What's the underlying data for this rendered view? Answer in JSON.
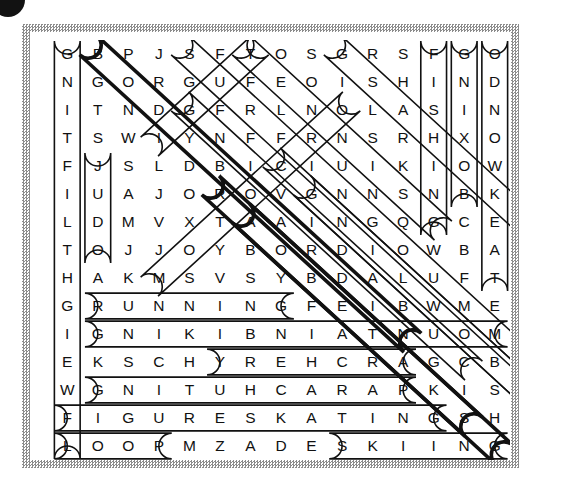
{
  "puzzle": {
    "type": "word-search",
    "rows": 15,
    "cols": 15,
    "grid": [
      [
        "G",
        "B",
        "P",
        "J",
        "S",
        "F",
        "T",
        "O",
        "S",
        "G",
        "R",
        "S",
        "F",
        "G",
        "O"
      ],
      [
        "N",
        "G",
        "O",
        "R",
        "G",
        "U",
        "F",
        "E",
        "O",
        "I",
        "S",
        "H",
        "I",
        "N",
        "D"
      ],
      [
        "I",
        "T",
        "N",
        "D",
        "G",
        "F",
        "R",
        "L",
        "N",
        "O",
        "L",
        "A",
        "S",
        "I",
        "N"
      ],
      [
        "T",
        "S",
        "W",
        "I",
        "Y",
        "N",
        "F",
        "F",
        "R",
        "N",
        "S",
        "R",
        "H",
        "X",
        "O"
      ],
      [
        "F",
        "J",
        "S",
        "L",
        "D",
        "B",
        "I",
        "C",
        "I",
        "U",
        "I",
        "K",
        "I",
        "O",
        "W"
      ],
      [
        "I",
        "U",
        "A",
        "J",
        "O",
        "R",
        "O",
        "V",
        "G",
        "N",
        "N",
        "S",
        "N",
        "B",
        "K"
      ],
      [
        "L",
        "D",
        "M",
        "V",
        "X",
        "T",
        "A",
        "A",
        "I",
        "N",
        "G",
        "Q",
        "G",
        "C",
        "E"
      ],
      [
        "T",
        "O",
        "J",
        "J",
        "O",
        "Y",
        "B",
        "O",
        "R",
        "D",
        "I",
        "O",
        "W",
        "B",
        "A"
      ],
      [
        "H",
        "A",
        "K",
        "M",
        "S",
        "V",
        "S",
        "Y",
        "B",
        "D",
        "A",
        "L",
        "U",
        "F",
        "T"
      ],
      [
        "G",
        "R",
        "U",
        "N",
        "N",
        "I",
        "N",
        "G",
        "F",
        "E",
        "I",
        "B",
        "W",
        "M",
        "E"
      ],
      [
        "I",
        "G",
        "N",
        "I",
        "K",
        "I",
        "B",
        "N",
        "I",
        "A",
        "T",
        "N",
        "U",
        "O",
        "M"
      ],
      [
        "E",
        "K",
        "S",
        "C",
        "H",
        "Y",
        "R",
        "E",
        "H",
        "C",
        "R",
        "A",
        "G",
        "C",
        "B"
      ],
      [
        "W",
        "G",
        "N",
        "I",
        "T",
        "U",
        "H",
        "C",
        "A",
        "R",
        "A",
        "P",
        "K",
        "I",
        "S"
      ],
      [
        "F",
        "I",
        "G",
        "U",
        "R",
        "E",
        "S",
        "K",
        "A",
        "T",
        "I",
        "N",
        "G",
        "S",
        "H"
      ],
      [
        "L",
        "O",
        "O",
        "P",
        "M",
        "Z",
        "A",
        "D",
        "E",
        "S",
        "K",
        "I",
        "I",
        "N",
        "G"
      ]
    ],
    "found_words": [
      {
        "name": "weightlifting",
        "text": "WEIGHTLIFTING",
        "direction": "vertical-up",
        "start": [
          14,
          0
        ],
        "end": [
          0,
          0
        ],
        "style": "thin"
      },
      {
        "name": "judo",
        "text": "JUDO",
        "direction": "vertical-down",
        "start": [
          4,
          1
        ],
        "end": [
          7,
          1
        ],
        "style": "thin"
      },
      {
        "name": "fishing",
        "text": "FISHING",
        "direction": "vertical-down",
        "start": [
          0,
          12
        ],
        "end": [
          6,
          12
        ],
        "style": "thin"
      },
      {
        "name": "boxing",
        "text": "BOXING",
        "direction": "vertical-up",
        "start": [
          5,
          13
        ],
        "end": [
          0,
          13
        ],
        "style": "thin"
      },
      {
        "name": "snowboarding",
        "text": "SNOWBOARDING",
        "direction": "vertical-up",
        "start": [
          8,
          14
        ],
        "end": [
          0,
          14
        ],
        "style": "thin"
      },
      {
        "name": "running",
        "text": "RUNNING",
        "direction": "horizontal",
        "start": [
          9,
          1
        ],
        "end": [
          9,
          7
        ],
        "style": "thin"
      },
      {
        "name": "mountainbiking",
        "text": "MOUNTAINBIKING",
        "direction": "horizontal-rev",
        "start": [
          10,
          14
        ],
        "end": [
          10,
          1
        ],
        "style": "thin"
      },
      {
        "name": "archery",
        "text": "ARCHERY",
        "direction": "horizontal-rev",
        "start": [
          11,
          11
        ],
        "end": [
          11,
          5
        ],
        "style": "thin"
      },
      {
        "name": "parachuting",
        "text": "PARACHUTING",
        "direction": "horizontal-rev",
        "start": [
          12,
          11
        ],
        "end": [
          12,
          1
        ],
        "style": "thin"
      },
      {
        "name": "figureskating",
        "text": "FIGURESKATING",
        "direction": "horizontal",
        "start": [
          13,
          0
        ],
        "end": [
          13,
          12
        ],
        "style": "thin"
      },
      {
        "name": "pool",
        "text": "POOL",
        "direction": "horizontal-rev",
        "start": [
          14,
          3
        ],
        "end": [
          14,
          0
        ],
        "style": "thin"
      },
      {
        "name": "skiing",
        "text": "SKIING",
        "direction": "horizontal",
        "start": [
          14,
          9
        ],
        "end": [
          14,
          14
        ],
        "style": "thin"
      },
      {
        "name": "bobsledding",
        "text": "BOBSLEDDING",
        "direction": "diagonal-dr",
        "start": [
          0,
          1
        ],
        "end": [
          10,
          11
        ],
        "style": "bold"
      },
      {
        "name": "snowboarding-d",
        "text": "SNOWBOARDING",
        "direction": "diagonal-dr",
        "start": [
          0,
          4
        ],
        "end": [
          11,
          15
        ],
        "style": "thin"
      },
      {
        "name": "surfing",
        "text": "SURFING",
        "direction": "diagonal-dr",
        "start": [
          0,
          6
        ],
        "end": [
          6,
          12
        ],
        "style": "thin"
      },
      {
        "name": "sailing",
        "text": "SAILING",
        "direction": "diagonal-dr",
        "start": [
          0,
          9
        ],
        "end": [
          6,
          15
        ],
        "style": "thin"
      },
      {
        "name": "golf",
        "text": "GOLF",
        "direction": "diagonal-ur",
        "start": [
          3,
          3
        ],
        "end": [
          0,
          6
        ],
        "style": "thin"
      },
      {
        "name": "diving",
        "text": "DIVING",
        "direction": "diagonal-ur",
        "start": [
          8,
          3
        ],
        "end": [
          2,
          9
        ],
        "style": "thin"
      },
      {
        "name": "gymnastics",
        "text": "GYMNASTICS",
        "direction": "diagonal-dr",
        "start": [
          2,
          4
        ],
        "end": [
          11,
          13
        ],
        "style": "thin"
      },
      {
        "name": "rowing",
        "text": "ROWING",
        "direction": "diagonal-dr",
        "start": [
          5,
          5
        ],
        "end": [
          13,
          13
        ],
        "style": "bold"
      },
      {
        "name": "canoeing",
        "text": "CANOEING",
        "direction": "diagonal-dr",
        "start": [
          6,
          6
        ],
        "end": [
          14,
          14
        ],
        "style": "bold"
      },
      {
        "name": "hiking",
        "text": "HIKING",
        "direction": "diagonal-dr",
        "start": [
          4,
          7
        ],
        "end": [
          12,
          15
        ],
        "style": "thin"
      },
      {
        "name": "cycling",
        "text": "CYCLING",
        "direction": "diagonal-dr",
        "start": [
          5,
          8
        ],
        "end": [
          13,
          16
        ],
        "style": "thin"
      }
    ]
  },
  "colors": {
    "ink": "#111111",
    "frame": "#8c8c8c",
    "paper": "#ffffff"
  }
}
